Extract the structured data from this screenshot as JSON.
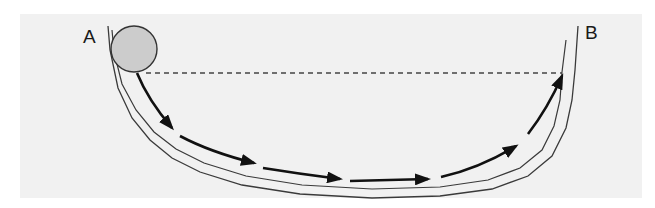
{
  "diagram": {
    "type": "physics-track",
    "labels": {
      "start": "A",
      "end": "B"
    },
    "ball": {
      "fill": "#cccccc",
      "stroke": "#333333"
    },
    "reference_line": {
      "style": "dashed",
      "meaning": "release height level"
    },
    "motion_arrows": 6,
    "colors": {
      "background": "#f1f1f1",
      "track": "#333333",
      "arrows": "#111111"
    }
  }
}
